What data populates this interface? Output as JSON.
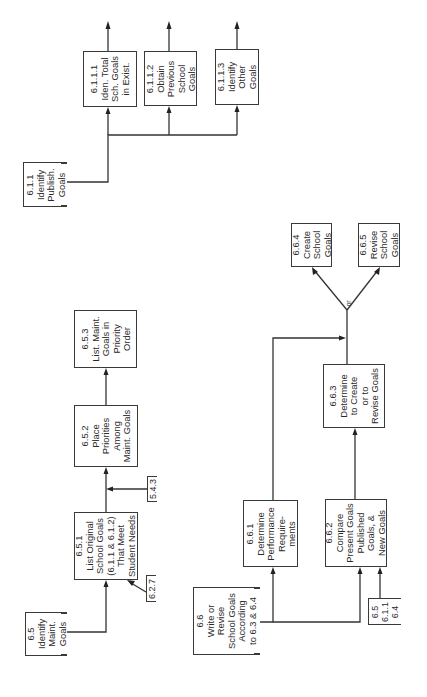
{
  "diagram": {
    "orientation": "rotated-90-ccw",
    "nodes": {
      "n6_1_1": {
        "id": "6.1.1",
        "lines": [
          "Identify",
          "Publish.",
          "Goals"
        ]
      },
      "n6_1_1_1": {
        "id": "6.1.1.1",
        "lines": [
          "Iden. Total",
          "Sch. Goals",
          "in Exist."
        ]
      },
      "n6_1_1_2": {
        "id": "6.1.1.2",
        "lines": [
          "Obtain",
          "Previous",
          "School",
          "Goals"
        ]
      },
      "n6_1_1_3": {
        "id": "6.1.1.3",
        "lines": [
          "Identify",
          "Other",
          "Goals"
        ]
      },
      "n6_5": {
        "id": "6.5",
        "lines": [
          "Identify",
          "Maint.",
          "Goals"
        ]
      },
      "n6_5_1": {
        "id": "6.5.1",
        "lines": [
          "List Original",
          "School Goals",
          "(6.1.1 & 6.1.2)",
          "That Meet",
          "Student Needs"
        ]
      },
      "n6_5_2": {
        "id": "6.5.2",
        "lines": [
          "Place",
          "Priorities",
          "Among",
          "Maint. Goals"
        ]
      },
      "n6_5_3": {
        "id": "6.5.3",
        "lines": [
          "List. Maint.",
          "Goals in",
          "Priority",
          "Order"
        ]
      },
      "n6_6": {
        "id": "6.6",
        "lines": [
          "Write or",
          "Revise",
          "School Goals",
          "According",
          "to 6.3 & 6.4"
        ]
      },
      "n6_6_1": {
        "id": "6.6.1",
        "lines": [
          "Determine",
          "Performance",
          "Require-",
          "ments"
        ]
      },
      "n6_6_2": {
        "id": "6.6.2",
        "lines": [
          "Compare",
          "Present Goals",
          "Published",
          "Goals, &",
          "New Goals"
        ]
      },
      "n6_6_3": {
        "id": "6.6.3",
        "lines": [
          "Determine",
          "to Create",
          "or to",
          "Revise Goals"
        ]
      },
      "n6_6_4": {
        "id": "6.6.4",
        "lines": [
          "Create",
          "School",
          "Goals"
        ]
      },
      "n6_6_5": {
        "id": "6.6.5",
        "lines": [
          "Revise",
          "School",
          "Goals"
        ]
      }
    },
    "references": {
      "r5_4_3": {
        "lines": [
          "5.4.3"
        ]
      },
      "r6_2_7": {
        "lines": [
          "6.2.7"
        ]
      },
      "r_multi": {
        "lines": [
          "6.5",
          "6.1.1",
          "6.4"
        ]
      }
    },
    "or_label": "or"
  }
}
